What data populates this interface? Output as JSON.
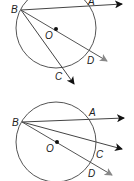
{
  "figures": [
    {
      "id": "figure-1",
      "labels": {
        "B": "B",
        "A": "A",
        "O": "O",
        "D": "D",
        "C": "C"
      },
      "description": "Circle O with rays from B: BA secant, BD through center, BC chord"
    },
    {
      "id": "figure-2",
      "labels": {
        "B": "B",
        "A": "A",
        "O": "O",
        "C": "C",
        "D": "D"
      },
      "description": "Circle O with rays from B: BA, BC, BD through center"
    }
  ],
  "colors": {
    "stroke": "#333333",
    "gray_arrow": "#888888"
  }
}
